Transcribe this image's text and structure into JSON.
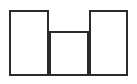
{
  "canvas": {
    "width": 137,
    "height": 84,
    "background_color": "#ffffff",
    "name": "three-rectangles-line-drawing"
  },
  "style": {
    "stroke_color": "#2b2b2b",
    "stroke_color_light": "#6e6e6e",
    "fill_color": "#ffffff",
    "stroke_width": 2
  },
  "chart_data": {
    "type": "diagram",
    "title": "",
    "subtitle": "",
    "xlabel": "",
    "ylabel": "",
    "shape_count": 3,
    "baseline_y": 76,
    "shapes": [
      {
        "id": "rect-left",
        "label": "left tall rectangle",
        "x": 9,
        "y": 10,
        "width": 40,
        "height": 66,
        "top_y": 10,
        "bottom_y": 76,
        "left_x": 9,
        "right_x": 49,
        "stroke": "#2b2b2b",
        "fill": "#ffffff"
      },
      {
        "id": "rect-middle",
        "label": "middle short rectangle",
        "x": 49,
        "y": 31,
        "width": 40,
        "height": 45,
        "top_y": 31,
        "bottom_y": 76,
        "left_x": 49,
        "right_x": 89,
        "stroke": "#2b2b2b",
        "fill": "#ffffff"
      },
      {
        "id": "rect-right",
        "label": "right tall rectangle",
        "x": 89,
        "y": 10,
        "width": 39,
        "height": 66,
        "top_y": 10,
        "bottom_y": 76,
        "left_x": 89,
        "right_x": 128,
        "stroke": "#2b2b2b",
        "fill": "#ffffff"
      }
    ],
    "annotations": [],
    "legend": [],
    "grid": false
  }
}
